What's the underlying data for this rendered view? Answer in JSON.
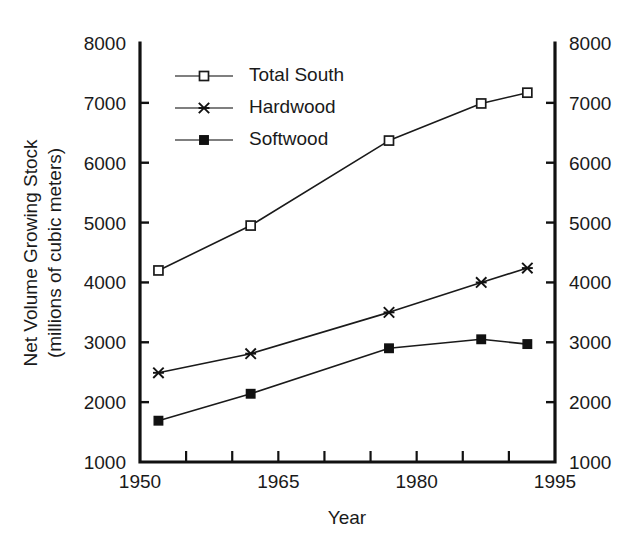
{
  "chart_data": {
    "type": "line",
    "title": "",
    "xlabel": "Year",
    "ylabel": "Net Volume Growing Stock\n(millions of cubic meters)",
    "ylabel_line1": "Net Volume Growing Stock",
    "ylabel_line2": "(millions of cubic meters)",
    "xlim": [
      1950,
      1995
    ],
    "ylim": [
      1000,
      8000
    ],
    "grid": false,
    "legend_position": "upper left inside",
    "x": [
      1952,
      1962,
      1977,
      1987,
      1992
    ],
    "xticks": [
      1950,
      1955,
      1960,
      1965,
      1970,
      1975,
      1980,
      1985,
      1990,
      1995
    ],
    "xtick_labels": [
      "1950",
      "",
      "",
      "1965",
      "",
      "",
      "1980",
      "",
      "",
      "1995"
    ],
    "xtick_labeled_values": [
      1950,
      1965,
      1980,
      1995
    ],
    "yticks": [
      1000,
      2000,
      3000,
      4000,
      5000,
      6000,
      7000,
      8000
    ],
    "ytick_labels": [
      "1000",
      "2000",
      "3000",
      "4000",
      "5000",
      "6000",
      "7000",
      "8000"
    ],
    "right_axis_labels": [
      "1000",
      "2000",
      "3000",
      "4000",
      "5000",
      "6000",
      "7000",
      "8000"
    ],
    "series": [
      {
        "name": "Total South",
        "marker": "open-square",
        "values": [
          4200,
          4950,
          6370,
          6990,
          7170
        ]
      },
      {
        "name": "Hardwood",
        "marker": "cross",
        "values": [
          2490,
          2810,
          3500,
          4000,
          4240
        ]
      },
      {
        "name": "Softwood",
        "marker": "filled-square",
        "values": [
          1690,
          2140,
          2900,
          3050,
          2970
        ]
      }
    ]
  },
  "legend": {
    "entries": [
      {
        "label": "Total South",
        "marker": "open-square"
      },
      {
        "label": "Hardwood",
        "marker": "cross"
      },
      {
        "label": "Softwood",
        "marker": "filled-square"
      }
    ]
  },
  "colors": {
    "line": "#1a1a1a",
    "axis": "#111111",
    "background": "#ffffff",
    "marker_fill_open": "#ffffff",
    "marker_fill_solid": "#111111"
  }
}
